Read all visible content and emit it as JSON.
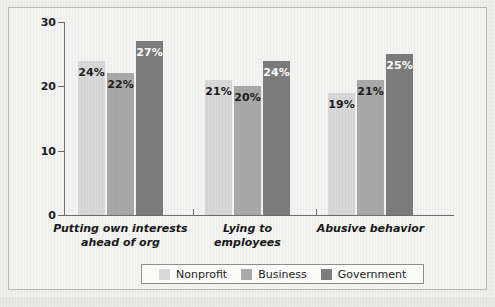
{
  "chart_data": {
    "type": "bar",
    "title": "",
    "subtitle": "",
    "xlabel": "",
    "ylabel": "",
    "ylim": [
      0,
      30
    ],
    "yticks": [
      "0",
      "10",
      "20",
      "30"
    ],
    "grid": false,
    "legend_position": "bottom",
    "categories": [
      "Putting own interests ahead of org",
      "Lying to employees",
      "Abusive behavior"
    ],
    "category_lines": [
      [
        "Putting own interests",
        "ahead of org"
      ],
      [
        "Lying to",
        "employees"
      ],
      [
        "Abusive behavior"
      ]
    ],
    "series": [
      {
        "name": "Nonprofit",
        "color": "#d9d9d9",
        "values": [
          24,
          21,
          19
        ],
        "labels": [
          "24%",
          "21%",
          "19%"
        ],
        "label_color": "#1d1d1d"
      },
      {
        "name": "Business",
        "color": "#a9a9a9",
        "values": [
          22,
          20,
          21
        ],
        "labels": [
          "22%",
          "20%",
          "21%"
        ],
        "label_color": "#1d1d1d"
      },
      {
        "name": "Government",
        "color": "#7c7c7c",
        "values": [
          27,
          24,
          25
        ],
        "labels": [
          "27%",
          "24%",
          "25%"
        ],
        "label_color": "#ffffff"
      }
    ]
  },
  "legend": {
    "items": [
      {
        "label": "Nonprofit",
        "color": "#d9d9d9"
      },
      {
        "label": "Business",
        "color": "#a9a9a9"
      },
      {
        "label": "Government",
        "color": "#7c7c7c"
      }
    ]
  },
  "axis": {
    "y_ticks": [
      "30",
      "20",
      "10",
      "0"
    ]
  }
}
